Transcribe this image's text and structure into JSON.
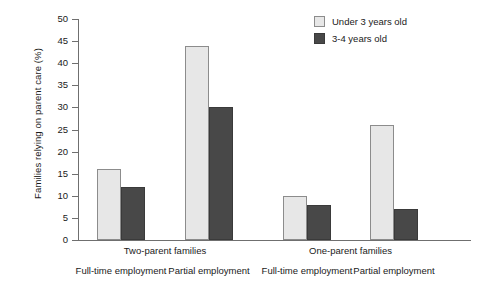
{
  "chart_data": {
    "type": "bar",
    "title": "",
    "xlabel": "",
    "ylabel": "Families relying on parent care (%)",
    "ylim": [
      0,
      50
    ],
    "yticks": [
      0,
      5,
      10,
      15,
      20,
      25,
      30,
      35,
      40,
      45,
      50
    ],
    "grid": false,
    "legend_position": "top-right",
    "categories": [
      "Full-time employment",
      "Partial employment",
      "Full-time employment",
      "Partial employment"
    ],
    "group_labels": [
      "Two-parent families",
      "One-parent families"
    ],
    "series": [
      {
        "name": "Under 3 years old",
        "color": "#e7e7e7",
        "values": [
          16,
          44,
          10,
          26
        ]
      },
      {
        "name": "3-4 years old",
        "color": "#484848",
        "values": [
          12,
          30,
          8,
          7
        ]
      }
    ]
  },
  "axis": {
    "y_title": "Families relying on parent care (%)",
    "y_labels": [
      "50",
      "45",
      "40",
      "35",
      "30",
      "25",
      "20",
      "15",
      "10",
      "5",
      "0"
    ]
  },
  "legend": {
    "items": [
      {
        "label": "Under 3 years old",
        "swatch": "light-gray-swatch"
      },
      {
        "label": "3-4 years old",
        "swatch": "dark-gray-swatch"
      }
    ]
  },
  "x_axis": {
    "groups": [
      {
        "label": "Two-parent families"
      },
      {
        "label": "One-parent families"
      }
    ],
    "sub_labels": [
      "Full-time employment",
      "Partial employment",
      "Full-time employment",
      "Partial employment"
    ]
  }
}
